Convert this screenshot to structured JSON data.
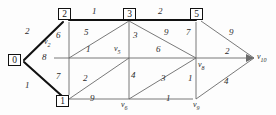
{
  "figure": {
    "type": "weighted-graph-diagram",
    "stroke_color": "#5a5a5a",
    "tree_edge_color": "#111111",
    "background": "#fdfdfd"
  },
  "nodes": [
    {
      "id": "n0",
      "label": "0",
      "boxed": true,
      "x": 14,
      "y": 60
    },
    {
      "id": "n2",
      "label": "2",
      "boxed": true,
      "x": 64,
      "y": 14
    },
    {
      "id": "n3",
      "label": "3",
      "boxed": true,
      "x": 129,
      "y": 14
    },
    {
      "id": "n5",
      "label": "5",
      "boxed": true,
      "x": 194,
      "y": 14
    },
    {
      "id": "n1",
      "label": "1",
      "boxed": true,
      "x": 62,
      "y": 101
    },
    {
      "id": "v2",
      "label": "v",
      "sub": "2",
      "boxed": false,
      "x": 48,
      "y": 40
    },
    {
      "id": "v5",
      "label": "v",
      "sub": "5",
      "boxed": false,
      "x": 118,
      "y": 48
    },
    {
      "id": "v6",
      "label": "v",
      "sub": "6",
      "boxed": false,
      "x": 124,
      "y": 101
    },
    {
      "id": "v8",
      "label": "v",
      "sub": "8",
      "boxed": false,
      "x": 199,
      "y": 63
    },
    {
      "id": "v9",
      "label": "v",
      "sub": "9",
      "boxed": false,
      "x": 196,
      "y": 101
    },
    {
      "id": "v10",
      "label": "v",
      "sub": "10",
      "boxed": false,
      "x": 261,
      "y": 60
    }
  ],
  "edge_weights": [
    {
      "id": "w_0_2",
      "value": "2",
      "x": 30,
      "y": 32
    },
    {
      "id": "w_0_1",
      "value": "1",
      "x": 30,
      "y": 86
    },
    {
      "id": "w_2_v2",
      "value": "6",
      "x": 58,
      "y": 36
    },
    {
      "id": "w_2_3",
      "value": "1",
      "x": 94,
      "y": 11
    },
    {
      "id": "w_3_5",
      "value": "2",
      "x": 160,
      "y": 11
    },
    {
      "id": "w_3_mid",
      "value": "5",
      "x": 86,
      "y": 33
    },
    {
      "id": "w_mid1",
      "value": "1",
      "x": 88,
      "y": 50
    },
    {
      "id": "w_3_v5",
      "value": "3",
      "x": 133,
      "y": 36
    },
    {
      "id": "w_v5_v8",
      "value": "6",
      "x": 158,
      "y": 50
    },
    {
      "id": "w_3_v8",
      "value": "9",
      "x": 166,
      "y": 33
    },
    {
      "id": "w_5_v8",
      "value": "7",
      "x": 190,
      "y": 33
    },
    {
      "id": "w_5_v10",
      "value": "9",
      "x": 231,
      "y": 33
    },
    {
      "id": "w_v8_v10",
      "value": "2",
      "x": 227,
      "y": 52
    },
    {
      "id": "w_0_mid",
      "value": "8",
      "x": 44,
      "y": 58
    },
    {
      "id": "w_1_v2",
      "value": "7",
      "x": 58,
      "y": 77
    },
    {
      "id": "w_1_v6d",
      "value": "2",
      "x": 85,
      "y": 79
    },
    {
      "id": "w_v5_v6",
      "value": "4",
      "x": 133,
      "y": 76
    },
    {
      "id": "w_v6_v8",
      "value": "3",
      "x": 163,
      "y": 79
    },
    {
      "id": "w_v8_v9",
      "value": "1",
      "x": 190,
      "y": 79
    },
    {
      "id": "w_1_v6",
      "value": "9",
      "x": 92,
      "y": 99
    },
    {
      "id": "w_v6_v9",
      "value": "1",
      "x": 168,
      "y": 99
    },
    {
      "id": "w_v9_v10",
      "value": "4",
      "x": 226,
      "y": 82
    }
  ],
  "edges": [
    {
      "id": "e_0_2",
      "from": "0",
      "to": "2",
      "weight": "2",
      "tree": true
    },
    {
      "id": "e_0_1",
      "from": "0",
      "to": "1",
      "weight": "1",
      "tree": true
    },
    {
      "id": "e_2_3",
      "from": "2",
      "to": "3",
      "weight": "1",
      "tree": true
    },
    {
      "id": "e_3_5",
      "from": "3",
      "to": "5",
      "weight": "2",
      "tree": true
    },
    {
      "id": "e_2_v2",
      "from": "2",
      "to": "v2",
      "weight": "6",
      "tree": false
    },
    {
      "id": "e_0_mid",
      "from": "0",
      "to": "v2",
      "weight": "8",
      "tree": false
    },
    {
      "id": "e_1_v2",
      "from": "1",
      "to": "v2",
      "weight": "7",
      "tree": false
    },
    {
      "id": "e_v2_3",
      "from": "v2",
      "to": "3",
      "weight": "5",
      "tree": false
    },
    {
      "id": "e_v2_v5",
      "from": "v2",
      "to": "v5",
      "weight": "1",
      "tree": false
    },
    {
      "id": "e_3_v5",
      "from": "3",
      "to": "v5",
      "weight": "3",
      "tree": false
    },
    {
      "id": "e_3_v8",
      "from": "3",
      "to": "v8",
      "weight": "9",
      "tree": false
    },
    {
      "id": "e_5_v8",
      "from": "5",
      "to": "v8",
      "weight": "7",
      "tree": false
    },
    {
      "id": "e_5_v10",
      "from": "5",
      "to": "v10",
      "weight": "9",
      "tree": false
    },
    {
      "id": "e_v5_v8",
      "from": "v5",
      "to": "v8",
      "weight": "6",
      "tree": false
    },
    {
      "id": "e_v8_v10",
      "from": "v8",
      "to": "v10",
      "weight": "2",
      "tree": false
    },
    {
      "id": "e_1_v5",
      "from": "1",
      "to": "v5",
      "weight": "2",
      "tree": false
    },
    {
      "id": "e_v5_v6",
      "from": "v5",
      "to": "v6",
      "weight": "4",
      "tree": false
    },
    {
      "id": "e_v6_v8",
      "from": "v6",
      "to": "v8",
      "weight": "3",
      "tree": false
    },
    {
      "id": "e_v8_v9",
      "from": "v8",
      "to": "v9",
      "weight": "1",
      "tree": false
    },
    {
      "id": "e_1_v6",
      "from": "1",
      "to": "v6",
      "weight": "9",
      "tree": false
    },
    {
      "id": "e_v6_v9",
      "from": "v6",
      "to": "v9",
      "weight": "1",
      "tree": false
    },
    {
      "id": "e_v9_v10",
      "from": "v9",
      "to": "v10",
      "weight": "4",
      "tree": false
    }
  ]
}
